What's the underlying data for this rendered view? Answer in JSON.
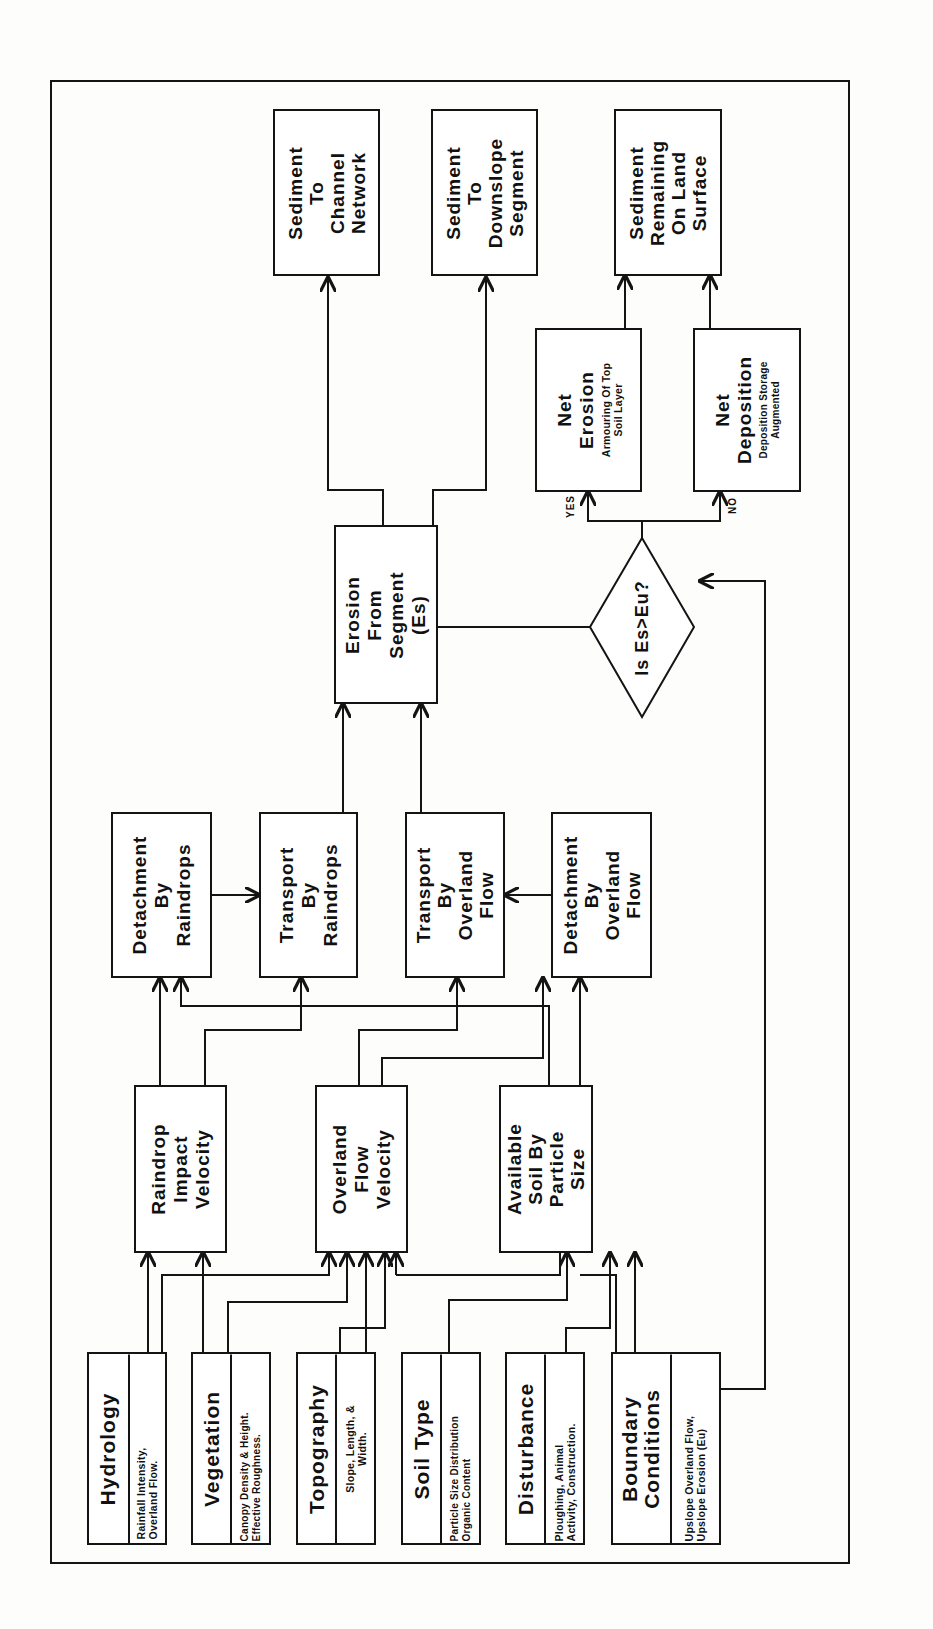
{
  "diagram": {
    "orientation": "rotated -90deg (read bottom-to-top)",
    "inputs": [
      {
        "id": "hydrology",
        "title": "Hydrology",
        "detail": [
          "Rainfall Intensity,",
          "Overland Flow."
        ]
      },
      {
        "id": "vegetation",
        "title": "Vegetation",
        "detail": [
          "Canopy Density & Height.",
          "Effective Roughness."
        ]
      },
      {
        "id": "topography",
        "title": "Topography",
        "detail": [
          "Slope, Length, &",
          "Width."
        ]
      },
      {
        "id": "soil_type",
        "title": "Soil Type",
        "detail": [
          "Particle Size Distribution",
          "Organic Content"
        ]
      },
      {
        "id": "disturbance",
        "title": "Disturbance",
        "detail": [
          "Ploughing, Animal",
          "Activity, Construction."
        ]
      },
      {
        "id": "boundary",
        "title": [
          "Boundary",
          "Conditions"
        ],
        "detail": [
          "Upslope Overland Flow,",
          "Upslope Erosion (Eu)"
        ]
      }
    ],
    "intermediate": [
      {
        "id": "raindrop_velocity",
        "lines": [
          "Raindrop",
          "Impact",
          "Velocity"
        ]
      },
      {
        "id": "overland_velocity",
        "lines": [
          "Overland",
          "Flow",
          "Velocity"
        ]
      },
      {
        "id": "available_soil",
        "lines": [
          "Available",
          "Soil By",
          "Particle",
          "Size"
        ]
      }
    ],
    "processes": [
      {
        "id": "detach_rain",
        "lines": [
          "Detachment",
          "By",
          "Raindrops"
        ]
      },
      {
        "id": "transport_rain",
        "lines": [
          "Transport",
          "By",
          "Raindrops"
        ]
      },
      {
        "id": "transport_flow",
        "lines": [
          "Transport",
          "By",
          "Overland",
          "Flow"
        ]
      },
      {
        "id": "detach_flow",
        "lines": [
          "Detachment",
          "By",
          "Overland",
          "Flow"
        ]
      }
    ],
    "erosion": {
      "lines": [
        "Erosion",
        "From",
        "Segment",
        "(Es)"
      ]
    },
    "outputs": [
      {
        "id": "to_channel",
        "lines": [
          "Sediment",
          "To",
          "Channel",
          "Network"
        ]
      },
      {
        "id": "to_downslope",
        "lines": [
          "Sediment",
          "To",
          "Downslope",
          "Segment"
        ]
      },
      {
        "id": "remaining",
        "lines": [
          "Sediment",
          "Remaining",
          "On Land",
          "Surface"
        ]
      }
    ],
    "decision": {
      "text": "Is Es>Eu?",
      "yes": "YES",
      "no": "NO"
    },
    "net_erosion": {
      "title": [
        "Net",
        "Erosion"
      ],
      "detail": [
        "Armouring Of Top",
        "Soil Layer"
      ]
    },
    "net_deposition": {
      "title": [
        "Net",
        "Deposition"
      ],
      "detail": [
        "Deposition Storage",
        "Augmented"
      ]
    }
  }
}
